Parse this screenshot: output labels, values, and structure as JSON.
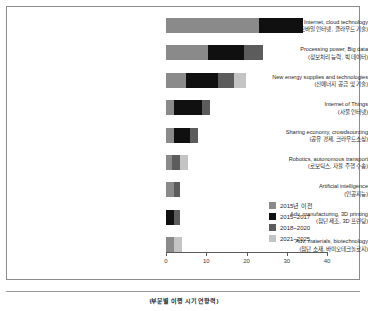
{
  "chart_data": {
    "type": "bar",
    "orientation": "horizontal",
    "stacked": true,
    "title": "",
    "xlabel": "",
    "ylabel": "",
    "xlim": [
      0,
      40
    ],
    "xticks": [
      0,
      10,
      20,
      30,
      40
    ],
    "xtick_labels": [
      "0",
      "10",
      "20",
      "30",
      "40"
    ],
    "grid": false,
    "legend_position": "lower-right-inside",
    "categories": [
      {
        "en": "Mobile Internet, cloud technology",
        "ko": "(모바일 인터넷, 클라우드 기술)"
      },
      {
        "en": "Processing power, Big data",
        "ko": "(정보처리 능력, 빅 데이터)"
      },
      {
        "en": "New energy supplies and technologies",
        "ko": "(신에너지 공급 및 기술)"
      },
      {
        "en": "Internet of Things",
        "ko": "(사물 인터넷)"
      },
      {
        "en": "Sharing economy, crowdsourcing",
        "ko": "(공유 경제, 크라우드소싱)"
      },
      {
        "en": "Robotics, autonomous transport",
        "ko": "(로보틱스, 자율 주행 수송)"
      },
      {
        "en": "Artificial intelligence",
        "ko": "(인공지능)"
      },
      {
        "en": "Adv. manufacturing, 3D printing",
        "ko": "(첨단 제조, 3D 프린팅)"
      },
      {
        "en": "Adv. materials, biotechnology",
        "ko": "(첨단 소재, 바이오테크놀로지)"
      }
    ],
    "series": [
      {
        "name": "2015년 이전",
        "color": "#8a8a8a",
        "values": [
          23,
          10.5,
          5,
          2,
          2,
          1.5,
          2,
          0,
          2
        ]
      },
      {
        "name": "2015~2017",
        "color": "#101010",
        "values": [
          11,
          9,
          8,
          7,
          4,
          0,
          0,
          2,
          0
        ]
      },
      {
        "name": "2018~2020",
        "color": "#5c5c5c",
        "values": [
          0,
          4.5,
          4,
          2,
          2,
          2,
          1.5,
          1.5,
          0
        ]
      },
      {
        "name": "2021~2025",
        "color": "#c4c4c4",
        "values": [
          0,
          0,
          3,
          0,
          0,
          2,
          0,
          0,
          2
        ]
      }
    ],
    "totals": [
      34,
      24,
      20,
      11,
      8,
      5.5,
      3.5,
      3.5,
      4
    ]
  },
  "legend": {
    "items": [
      {
        "label": "2015년 이전",
        "color": "#8a8a8a"
      },
      {
        "label": "2015~2017",
        "color": "#101010"
      },
      {
        "label": "2018~2020",
        "color": "#5c5c5c"
      },
      {
        "label": "2021~2025",
        "color": "#c4c4c4"
      }
    ]
  },
  "caption": "(부문별 이행 시기 연향력)"
}
